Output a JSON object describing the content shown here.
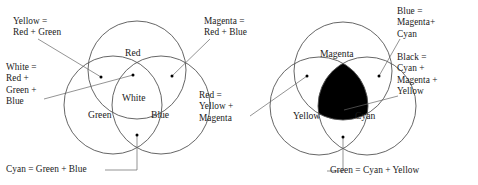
{
  "figure": {
    "stroke_color": "#555555",
    "leader_color": "#666666",
    "text_color": "#1a1a1a",
    "fill_black": "#000000",
    "background": "#ffffff"
  },
  "additive": {
    "name": "RGB additive color diagram",
    "circles": [
      {
        "name": "red-circle",
        "label": "Red",
        "cx": 137,
        "cy": 70,
        "r": 49
      },
      {
        "name": "green-circle",
        "label": "Green",
        "cx": 113,
        "cy": 105,
        "r": 49
      },
      {
        "name": "blue-circle",
        "label": "Blue",
        "cx": 161,
        "cy": 105,
        "r": 49
      }
    ],
    "center_label": "White",
    "labels": {
      "yellow": "Yellow =\nRed + Green",
      "white": "White =\nRed +\nGreen +\nBlue",
      "cyan": "Cyan = Green + Blue",
      "magenta": "Magenta =\nRed + Blue"
    }
  },
  "subtractive": {
    "name": "CMY subtractive color diagram",
    "circles": [
      {
        "name": "magenta-circle",
        "label": "Magenta",
        "cx": 343,
        "cy": 71,
        "r": 49
      },
      {
        "name": "yellow-circle",
        "label": "Yellow",
        "cx": 319,
        "cy": 106,
        "r": 49
      },
      {
        "name": "cyan-circle",
        "label": "Cyan",
        "cx": 367,
        "cy": 106,
        "r": 49
      }
    ],
    "center_fill": "black",
    "labels": {
      "red": "Red =\nYellow +\nMagenta",
      "blue": "Blue =\nMagenta+\nCyan",
      "black": "Black =\nCyan +\nMagenta +\nYellow",
      "green": "Green = Cyan + Yellow"
    }
  }
}
